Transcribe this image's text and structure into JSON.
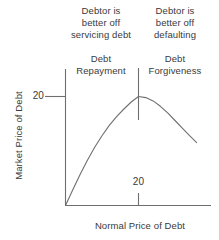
{
  "colors": {
    "background": "#ffffff",
    "line": "#6f6f6f",
    "text": "#3a3a3a"
  },
  "figure": {
    "annotation_left": "Debtor is\nbetter off\nservicing debt",
    "annotation_right": "Debtor is\nbetter off\ndefaulting",
    "region_left": "Debt\nRepayment",
    "region_right": "Debt\nForgiveness",
    "y_axis_label": "Market Price of Debt",
    "x_axis_label": "Normal Price of Debt",
    "y_tick": "20",
    "x_tick": "20"
  },
  "chart_data": {
    "type": "line",
    "title": "",
    "xlabel": "Normal Price of Debt",
    "ylabel": "Market Price of Debt",
    "xlim": [
      0,
      40
    ],
    "ylim": [
      0,
      25
    ],
    "x_ticks": [
      20
    ],
    "y_ticks": [
      20
    ],
    "grid": false,
    "legend": null,
    "series": [
      {
        "name": "market-price-of-debt-curve",
        "x": [
          0,
          2,
          4,
          6,
          8,
          10,
          12,
          14,
          16,
          18,
          20,
          22,
          24,
          26,
          28,
          30,
          32,
          34,
          36
        ],
        "y": [
          0,
          2.9,
          5.7,
          8.3,
          10.7,
          12.8,
          14.7,
          16.3,
          17.7,
          19.0,
          20.0,
          19.8,
          19.2,
          18.2,
          17.0,
          15.6,
          14.2,
          12.8,
          11.5
        ]
      }
    ],
    "peak": {
      "x": 20,
      "y": 20
    },
    "divider_x": 20,
    "annotations": [
      {
        "text": "Debtor is better off servicing debt",
        "region": "x < 20"
      },
      {
        "text": "Debtor is better off defaulting",
        "region": "x > 20"
      },
      {
        "text": "Debt Repayment",
        "region": "x < 20"
      },
      {
        "text": "Debt Forgiveness",
        "region": "x > 20"
      }
    ]
  }
}
